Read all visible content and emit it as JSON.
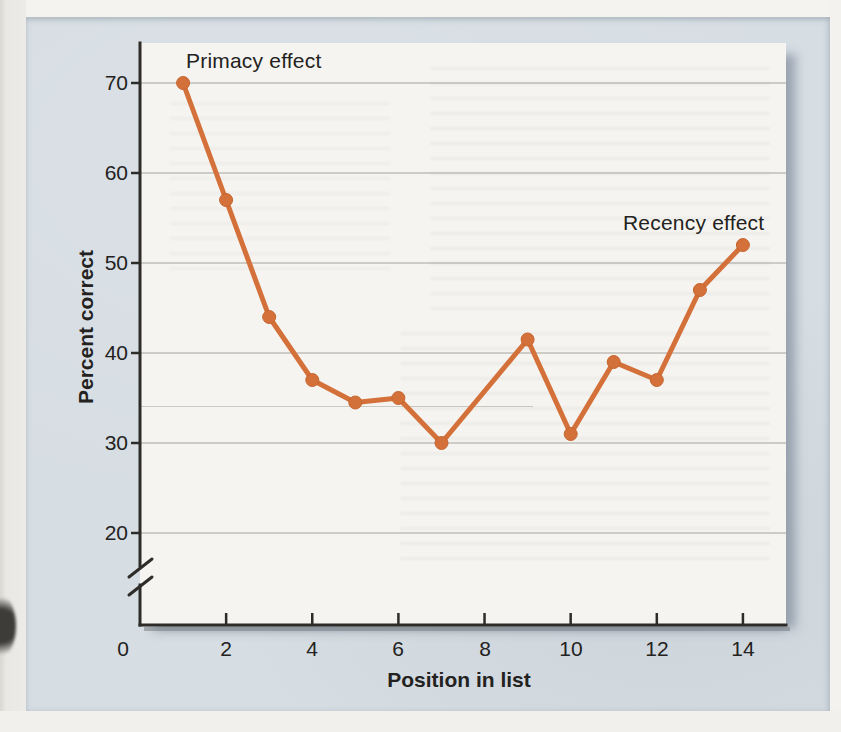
{
  "figure": {
    "annotations": {
      "primacy": "Primacy effect",
      "recency": "Recency effect"
    }
  },
  "chart_data": {
    "type": "line",
    "title": "",
    "xlabel": "Position in list",
    "ylabel": "Percent correct",
    "x": [
      1,
      2,
      3,
      4,
      5,
      6,
      7,
      9,
      10,
      11,
      12,
      13,
      14
    ],
    "y": [
      70,
      57,
      44,
      37,
      34.5,
      35,
      30,
      41.5,
      31,
      39,
      37,
      47,
      52
    ],
    "x_ticks": [
      0,
      2,
      4,
      6,
      8,
      10,
      12,
      14
    ],
    "y_ticks": [
      70,
      60,
      50,
      40,
      30,
      20
    ],
    "xlim": [
      0,
      15
    ],
    "ylim": [
      0,
      75
    ],
    "y_axis_break_below": 20,
    "grid": "horizontal",
    "legend": false,
    "marker": "circle",
    "annotations": [
      {
        "text": "Primacy effect",
        "near_x": 1,
        "near_y": 70
      },
      {
        "text": "Recency effect",
        "near_x": 14,
        "near_y": 52
      }
    ]
  },
  "colors": {
    "accent_orange": "#d4713a",
    "marker_edge": "#c6652f",
    "panel_background": "#d6dde3",
    "plot_background": "#f5f4f0",
    "axis_color": "#2e2c29",
    "grid_color": "#96948f",
    "text_color": "#232220",
    "page_background": "#f1f0ec"
  }
}
